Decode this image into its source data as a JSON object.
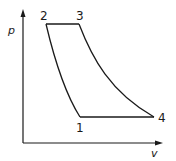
{
  "diagram": {
    "type": "pv-diagram",
    "axes": {
      "y_label": "p",
      "x_label": "v"
    },
    "points": [
      {
        "label": "1",
        "x": 80,
        "y": 117
      },
      {
        "label": "2",
        "x": 46,
        "y": 24
      },
      {
        "label": "3",
        "x": 79,
        "y": 24
      },
      {
        "label": "4",
        "x": 154,
        "y": 117
      }
    ],
    "processes": [
      {
        "from": "1",
        "to": "2",
        "shape": "curve",
        "note": "compression"
      },
      {
        "from": "2",
        "to": "3",
        "shape": "horizontal line",
        "note": "constant pressure heat addition"
      },
      {
        "from": "3",
        "to": "4",
        "shape": "curve",
        "note": "expansion"
      },
      {
        "from": "4",
        "to": "1",
        "shape": "horizontal line",
        "note": "constant pressure heat rejection"
      }
    ],
    "colors": {
      "line": "#1a1a1a",
      "background": "#ffffff"
    }
  }
}
